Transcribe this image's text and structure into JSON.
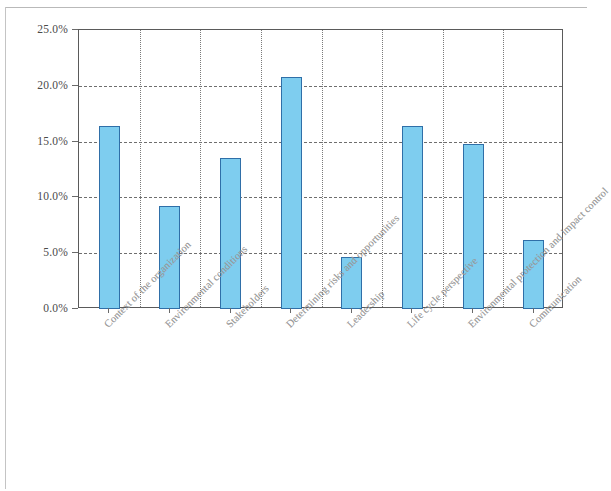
{
  "chart_data": {
    "type": "bar",
    "title": "",
    "subtitle": "",
    "xlabel": "",
    "ylabel": "",
    "ylim": [
      0,
      25
    ],
    "ytick_values": [
      0,
      5,
      10,
      15,
      20,
      25
    ],
    "ytick_labels": [
      "0.0%",
      "5.0%",
      "10.0%",
      "15.0%",
      "20.0%",
      "25.0%"
    ],
    "grid": "horizontal-and-vertical",
    "legend": "none",
    "categories": [
      "Context of the organization",
      "Environmental conditions",
      "Stakeholders",
      "Determining risks and opportunities",
      "Leadership",
      "Life cycle perspective",
      "Environmental protection and impact control",
      "Communication"
    ],
    "values": [
      16.4,
      9.2,
      13.5,
      20.8,
      4.7,
      16.4,
      14.8,
      6.2
    ],
    "value_labels": [
      "16.4%",
      "9.2%",
      "13.5%",
      "20.8%",
      "4.7%",
      "16.4%",
      "14.8%",
      "6.2%"
    ],
    "bar_fill_color": "#7ecdef",
    "bar_border_color": "#2f6fa8",
    "axis_color": "#5a5a5a",
    "grid_color": "#6e6e6e",
    "label_color": "#9a9a9a",
    "tick_label_color": "#4a4a4a"
  }
}
